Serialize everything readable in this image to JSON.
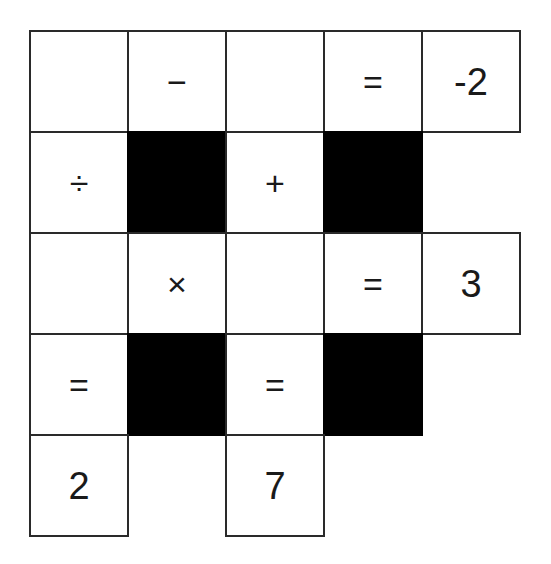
{
  "puzzle": {
    "type": "math-crossword",
    "rows": 5,
    "cols": 5,
    "cells": [
      {
        "r": 0,
        "c": 0,
        "kind": "blank",
        "value": ""
      },
      {
        "r": 0,
        "c": 1,
        "kind": "op",
        "value": "−"
      },
      {
        "r": 0,
        "c": 2,
        "kind": "blank",
        "value": ""
      },
      {
        "r": 0,
        "c": 3,
        "kind": "op",
        "value": "="
      },
      {
        "r": 0,
        "c": 4,
        "kind": "number",
        "value": "-2"
      },
      {
        "r": 1,
        "c": 0,
        "kind": "op",
        "value": "÷"
      },
      {
        "r": 1,
        "c": 1,
        "kind": "black",
        "value": ""
      },
      {
        "r": 1,
        "c": 2,
        "kind": "op",
        "value": "+"
      },
      {
        "r": 1,
        "c": 3,
        "kind": "black",
        "value": ""
      },
      {
        "r": 2,
        "c": 0,
        "kind": "blank",
        "value": ""
      },
      {
        "r": 2,
        "c": 1,
        "kind": "op",
        "value": "×"
      },
      {
        "r": 2,
        "c": 2,
        "kind": "blank",
        "value": ""
      },
      {
        "r": 2,
        "c": 3,
        "kind": "op",
        "value": "="
      },
      {
        "r": 2,
        "c": 4,
        "kind": "number",
        "value": "3"
      },
      {
        "r": 3,
        "c": 0,
        "kind": "op",
        "value": "="
      },
      {
        "r": 3,
        "c": 1,
        "kind": "black",
        "value": ""
      },
      {
        "r": 3,
        "c": 2,
        "kind": "op",
        "value": "="
      },
      {
        "r": 3,
        "c": 3,
        "kind": "black",
        "value": ""
      },
      {
        "r": 4,
        "c": 0,
        "kind": "number",
        "value": "2"
      },
      {
        "r": 4,
        "c": 2,
        "kind": "number",
        "value": "7"
      }
    ]
  }
}
